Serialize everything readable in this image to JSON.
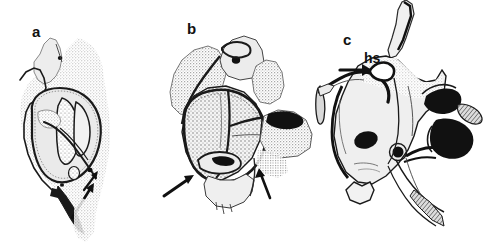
{
  "figure": {
    "background_color": "#ffffff",
    "ink_color": "#1a1a1a",
    "stipple_color": "#8c8c8c",
    "fill_light": "#e8e8e8",
    "fill_dark": "#111111"
  },
  "panels": [
    {
      "id": "a",
      "label": "a",
      "caption_labels": [],
      "arrows": [
        {
          "name": "arrow-a-lower",
          "direction": "up-right"
        },
        {
          "name": "arrow-a-inner",
          "direction": "up-right"
        }
      ]
    },
    {
      "id": "b",
      "label": "b",
      "caption_labels": [],
      "arrows": [
        {
          "name": "arrow-b-left",
          "direction": "up-right"
        },
        {
          "name": "arrow-b-right",
          "direction": "up-left"
        }
      ]
    },
    {
      "id": "c",
      "label": "c",
      "caption_labels": [
        {
          "name": "hs-label",
          "text": "hs"
        }
      ],
      "arrows": [
        {
          "name": "arrow-c",
          "direction": "right"
        }
      ]
    }
  ],
  "labels": {
    "panel_a": "a",
    "panel_b": "b",
    "panel_c": "c",
    "structure_hs": "hs"
  }
}
